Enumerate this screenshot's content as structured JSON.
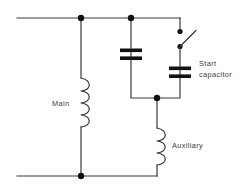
{
  "diagram": {
    "background_color": "#ffffff",
    "line_color": "#3a3a3a",
    "node_color": "#111111",
    "text_color": "#3d3d3d"
  },
  "labels": {
    "main_winding": "Main",
    "auxiliary_winding": "Auxiliary",
    "start_capacitor_line1": "Start",
    "start_capacitor_line2": "capacitor"
  },
  "components": [
    {
      "name": "main-winding",
      "type": "inductor",
      "label": "Main",
      "orientation": "vertical",
      "turns": 4
    },
    {
      "name": "auxiliary-winding",
      "type": "inductor",
      "label": "Auxiliary",
      "orientation": "vertical",
      "turns": 4
    },
    {
      "name": "run-capacitor",
      "type": "capacitor",
      "label": "",
      "orientation": "vertical",
      "plates": 2
    },
    {
      "name": "start-capacitor",
      "type": "capacitor",
      "label": "Start capacitor",
      "orientation": "vertical",
      "plates": 2
    },
    {
      "name": "centrifugal-switch",
      "type": "switch",
      "state": "open",
      "orientation": "vertical"
    }
  ],
  "nodes": [
    {
      "name": "top-left-junction",
      "x": 81,
      "y": 18
    },
    {
      "name": "top-mid-junction",
      "x": 131,
      "y": 18
    },
    {
      "name": "mid-junction",
      "x": 157,
      "y": 98
    },
    {
      "name": "bottom-left-junction",
      "x": 81,
      "y": 176
    }
  ],
  "rails": {
    "top_supply": "top supply line",
    "bottom_supply": "bottom supply line"
  }
}
